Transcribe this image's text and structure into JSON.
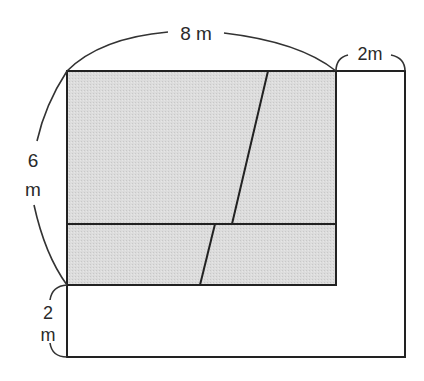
{
  "diagram": {
    "type": "floor-plan-area-figure",
    "shaded_fill": "#d9d9d9",
    "line_color": "#222222",
    "labels": {
      "top_width": "8 m",
      "right_extension": "2m",
      "left_height_num": "6",
      "left_height_unit": "m",
      "bottom_extension_num": "2",
      "bottom_extension_unit": "m"
    },
    "shapes": {
      "outer_rect": {
        "x": 67,
        "y": 71,
        "w": 338,
        "h": 286
      },
      "shaded_rect": {
        "x": 67,
        "y": 71,
        "w": 269,
        "h": 214
      },
      "horizontal_divider_y": 224,
      "slant_top": {
        "x1": 268,
        "y1": 71,
        "x2": 232,
        "y2": 224
      },
      "slant_bottom": {
        "x1": 215,
        "y1": 224,
        "x2": 200,
        "y2": 285
      }
    }
  }
}
